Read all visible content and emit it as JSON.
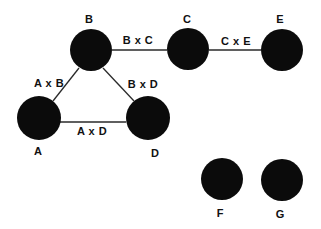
{
  "diagram": {
    "type": "undirected-graph",
    "colors": {
      "node": "#0b0b0b",
      "edge": "#2a2a2a",
      "text": "#111111",
      "background": "#ffffff"
    },
    "nodes": [
      {
        "id": "A",
        "label": "A",
        "cx": 39,
        "cy": 118,
        "r": 22,
        "lx": 38,
        "ly": 155
      },
      {
        "id": "B",
        "label": "B",
        "cx": 91,
        "cy": 50,
        "r": 21,
        "lx": 89,
        "ly": 23
      },
      {
        "id": "C",
        "label": "C",
        "cx": 188,
        "cy": 49,
        "r": 21,
        "lx": 187,
        "ly": 23
      },
      {
        "id": "D",
        "label": "D",
        "cx": 148,
        "cy": 118,
        "r": 22,
        "lx": 155,
        "ly": 157
      },
      {
        "id": "E",
        "label": "E",
        "cx": 282,
        "cy": 50,
        "r": 21,
        "lx": 280,
        "ly": 23
      },
      {
        "id": "F",
        "label": "F",
        "cx": 222,
        "cy": 179,
        "r": 21,
        "lx": 220,
        "ly": 217
      },
      {
        "id": "G",
        "label": "G",
        "cx": 282,
        "cy": 180,
        "r": 21,
        "lx": 280,
        "ly": 218
      }
    ],
    "edges": [
      {
        "from": "B",
        "to": "C",
        "label": "B x C",
        "x1": 112,
        "y1": 50,
        "x2": 167,
        "y2": 50,
        "lx": 138,
        "ly": 44
      },
      {
        "from": "C",
        "to": "E",
        "label": "C x E",
        "x1": 209,
        "y1": 50,
        "x2": 261,
        "y2": 50,
        "lx": 236,
        "ly": 45
      },
      {
        "from": "A",
        "to": "B",
        "label": "A x B",
        "x1": 53,
        "y1": 101,
        "x2": 79,
        "y2": 68,
        "lx": 49,
        "ly": 87
      },
      {
        "from": "B",
        "to": "D",
        "label": "B x D",
        "x1": 103,
        "y1": 68,
        "x2": 134,
        "y2": 101,
        "lx": 143,
        "ly": 88
      },
      {
        "from": "A",
        "to": "D",
        "label": "A x D",
        "x1": 60,
        "y1": 122,
        "x2": 126,
        "y2": 122,
        "lx": 92,
        "ly": 135
      }
    ]
  }
}
